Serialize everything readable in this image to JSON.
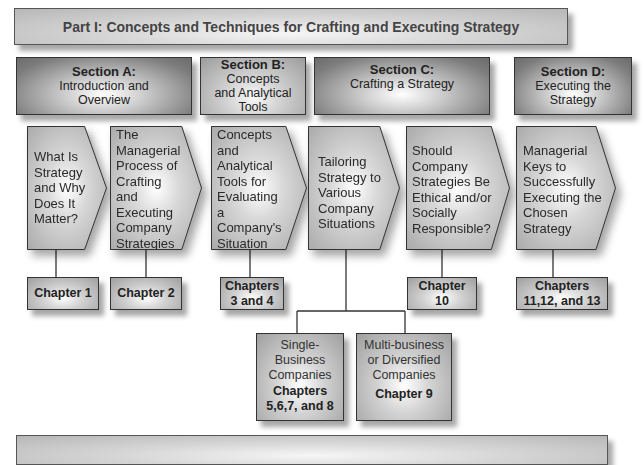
{
  "part_banner": {
    "title": "Part I: Concepts and Techniques for Crafting and Executing Strategy"
  },
  "sections": [
    {
      "id": "A",
      "title": "Section A:",
      "subtitle_lines": [
        "Introduction and",
        "Overview"
      ]
    },
    {
      "id": "B",
      "title": "Section B:",
      "subtitle_lines": [
        "Concepts",
        "and Analytical",
        "Tools"
      ]
    },
    {
      "id": "C",
      "title": "Section C:",
      "subtitle_lines": [
        "Crafting a Strategy"
      ]
    },
    {
      "id": "D",
      "title": "Section D:",
      "subtitle_lines": [
        "Executing the",
        "Strategy"
      ]
    }
  ],
  "topics": [
    {
      "lines": [
        "What Is",
        "Strategy",
        "and Why",
        "Does It",
        "Matter?"
      ]
    },
    {
      "lines": [
        "The",
        "Managerial",
        "Process of",
        "Crafting",
        "and",
        "Executing",
        "Company",
        "Strategies"
      ]
    },
    {
      "lines": [
        "Concepts",
        "and",
        "Analytical",
        "Tools for",
        "Evaluating",
        "a",
        "Company's",
        "Situation"
      ]
    },
    {
      "lines": [
        "Tailoring",
        "Strategy to",
        "Various",
        "Company",
        "Situations"
      ]
    },
    {
      "lines": [
        "Should",
        "Company",
        "Strategies Be",
        "Ethical and/or",
        "Socially",
        "Responsible?"
      ]
    },
    {
      "lines": [
        "Managerial",
        "Keys to",
        "Successfully",
        "Executing the",
        "Chosen",
        "Strategy"
      ]
    }
  ],
  "chapters": [
    {
      "lines": [
        "Chapter 1"
      ]
    },
    {
      "lines": [
        "Chapter 2"
      ]
    },
    {
      "lines": [
        "Chapters",
        "3 and 4"
      ]
    },
    {
      "lines": [
        "Chapter",
        "10"
      ]
    },
    {
      "lines": [
        "Chapters",
        "11,12, and 13"
      ]
    }
  ],
  "sub_topics": [
    {
      "lines": [
        "Single-",
        "Business",
        "Companies"
      ],
      "chapter_lines": [
        "Chapters",
        "5,6,7, and 8"
      ]
    },
    {
      "lines": [
        "Multi-business",
        "or Diversified",
        "Companies"
      ],
      "chapter_lines": [
        "Chapter 9"
      ]
    }
  ],
  "bottom_banner": {
    "title": ""
  }
}
